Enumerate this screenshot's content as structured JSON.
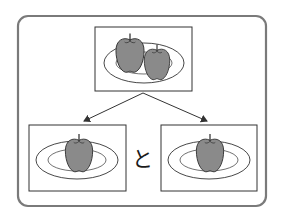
{
  "diagram": {
    "type": "split-illustration",
    "top_panel": {
      "content": "two apples on a plate"
    },
    "bottom_panels": [
      {
        "content": "one apple on a plate"
      },
      {
        "content": "one apple on a plate"
      }
    ],
    "conjunction": "と",
    "arrows": [
      {
        "from": "top_panel",
        "to": "bottom_panels.0"
      },
      {
        "from": "top_panel",
        "to": "bottom_panels.1"
      }
    ]
  },
  "colors": {
    "frame": "#7a7a7a",
    "box_border": "#333333",
    "apple_fill": "#8a8a8a",
    "outline": "#333333",
    "plate_fill": "#ffffff"
  }
}
